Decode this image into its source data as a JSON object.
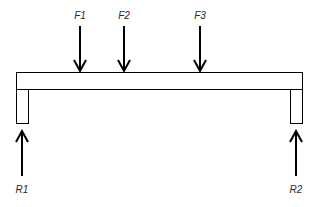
{
  "diagram": {
    "type": "simply-supported beam free body diagram",
    "beam": {
      "x1": 16,
      "x2": 303,
      "y1": 72,
      "y2": 90
    },
    "supports": [
      {
        "id": "left",
        "x1": 16,
        "x2": 29,
        "y1": 90,
        "y2": 124
      },
      {
        "id": "right",
        "x1": 290,
        "x2": 303,
        "y1": 90,
        "y2": 124
      }
    ],
    "loads": [
      {
        "label": "F1",
        "x": 80,
        "direction": "down"
      },
      {
        "label": "F2",
        "x": 124,
        "direction": "down"
      },
      {
        "label": "F3",
        "x": 200,
        "direction": "down"
      }
    ],
    "reactions": [
      {
        "label": "R1",
        "x": 22,
        "direction": "up"
      },
      {
        "label": "R2",
        "x": 296,
        "direction": "up"
      }
    ],
    "colors": {
      "stroke": "#000000",
      "background": "#ffffff"
    }
  }
}
